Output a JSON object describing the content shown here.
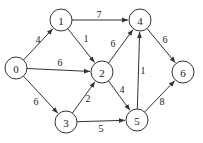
{
  "graph": {
    "type": "directed-weighted",
    "nodes": [
      {
        "id": "0",
        "label": "0",
        "x": 16,
        "y": 68
      },
      {
        "id": "1",
        "label": "1",
        "x": 61,
        "y": 20
      },
      {
        "id": "2",
        "label": "2",
        "x": 102,
        "y": 72
      },
      {
        "id": "3",
        "label": "3",
        "x": 66,
        "y": 122
      },
      {
        "id": "4",
        "label": "4",
        "x": 140,
        "y": 20
      },
      {
        "id": "5",
        "label": "5",
        "x": 137,
        "y": 120
      },
      {
        "id": "6",
        "label": "6",
        "x": 183,
        "y": 72
      }
    ],
    "edges": [
      {
        "from": "0",
        "to": "1",
        "weight": "4",
        "lx": 38,
        "ly": 39
      },
      {
        "from": "0",
        "to": "2",
        "weight": "6",
        "lx": 60,
        "ly": 62
      },
      {
        "from": "0",
        "to": "3",
        "weight": "6",
        "lx": 36,
        "ly": 101
      },
      {
        "from": "1",
        "to": "4",
        "weight": "7",
        "lx": 99,
        "ly": 14
      },
      {
        "from": "1",
        "to": "2",
        "weight": "1",
        "lx": 86,
        "ly": 38
      },
      {
        "from": "2",
        "to": "4",
        "weight": "6",
        "lx": 113,
        "ly": 43
      },
      {
        "from": "3",
        "to": "2",
        "weight": "2",
        "lx": 88,
        "ly": 98
      },
      {
        "from": "2",
        "to": "5",
        "weight": "4",
        "lx": 122,
        "ly": 89
      },
      {
        "from": "3",
        "to": "5",
        "weight": "5",
        "lx": 101,
        "ly": 128
      },
      {
        "from": "5",
        "to": "4",
        "weight": "1",
        "lx": 143,
        "ly": 70
      },
      {
        "from": "4",
        "to": "6",
        "weight": "6",
        "lx": 165,
        "ly": 39
      },
      {
        "from": "5",
        "to": "6",
        "weight": "8",
        "lx": 162,
        "ly": 101
      }
    ]
  }
}
